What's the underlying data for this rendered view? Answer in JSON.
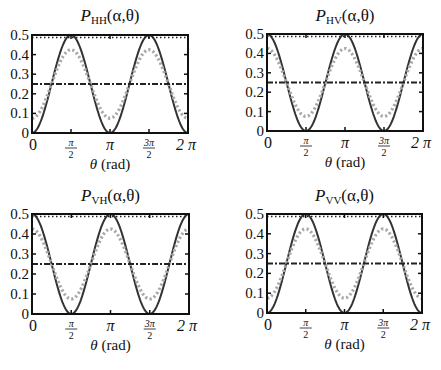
{
  "chart_data": [
    {
      "type": "line",
      "title": "P_HH(α,θ)",
      "title_main": "P",
      "title_sub": "HH",
      "title_args": "(α,θ)",
      "xlabel": "θ (rad)",
      "xlabel_sym": "θ",
      "xlabel_unit": " (rad)",
      "ylabel": "",
      "xlim": [
        0,
        6.2832
      ],
      "ylim": [
        0,
        0.5
      ],
      "xticks": [
        "0",
        "π/2",
        "π",
        "3π/2",
        "2π"
      ],
      "yticks": [
        "0",
        "0.1",
        "0.2",
        "0.3",
        "0.4",
        "0.5"
      ],
      "grid": false,
      "series": [
        {
          "name": "solid",
          "style": "solid",
          "color": "#333333",
          "formula": "0.25*(1-cos(2θ))",
          "x": [
            0,
            0.785,
            1.571,
            2.356,
            3.142,
            3.927,
            4.712,
            5.498,
            6.283
          ],
          "values": [
            0,
            0.25,
            0.5,
            0.25,
            0,
            0.25,
            0.5,
            0.25,
            0
          ]
        },
        {
          "name": "gray-dotted",
          "style": "dotted",
          "color": "#a8a8a8",
          "formula": "0.25-0.175*cos(2θ)",
          "x": [
            0,
            0.785,
            1.571,
            2.356,
            3.142,
            3.927,
            4.712,
            5.498,
            6.283
          ],
          "values": [
            0.075,
            0.25,
            0.425,
            0.25,
            0.075,
            0.25,
            0.425,
            0.25,
            0.075
          ]
        },
        {
          "name": "dash-dot",
          "style": "dashdot",
          "color": "#222222",
          "formula": "0.25",
          "x": [
            0,
            6.283
          ],
          "values": [
            0.25,
            0.25
          ]
        },
        {
          "name": "top-dotted",
          "style": "dotted-black",
          "color": "#222222",
          "formula": "0.5",
          "x": [
            0,
            6.283
          ],
          "values": [
            0.5,
            0.5
          ]
        }
      ],
      "box": {
        "left": 32,
        "top": 35,
        "right": 188,
        "bottom": 133
      }
    },
    {
      "type": "line",
      "title": "P_HV(α,θ)",
      "title_main": "P",
      "title_sub": "HV",
      "title_args": "(α,θ)",
      "xlabel": "θ (rad)",
      "xlabel_sym": "θ",
      "xlabel_unit": " (rad)",
      "ylabel": "",
      "xlim": [
        0,
        6.2832
      ],
      "ylim": [
        0,
        0.5
      ],
      "xticks": [
        "0",
        "π/2",
        "π",
        "3π/2",
        "2π"
      ],
      "yticks": [
        "0",
        "0.1",
        "0.2",
        "0.3",
        "0.4",
        "0.5"
      ],
      "grid": false,
      "series": [
        {
          "name": "solid",
          "style": "solid",
          "color": "#333333",
          "formula": "0.25*(1+cos(2θ))",
          "x": [
            0,
            0.785,
            1.571,
            2.356,
            3.142,
            3.927,
            4.712,
            5.498,
            6.283
          ],
          "values": [
            0.5,
            0.25,
            0,
            0.25,
            0.5,
            0.25,
            0,
            0.25,
            0.5
          ]
        },
        {
          "name": "gray-dotted",
          "style": "dotted",
          "color": "#a8a8a8",
          "formula": "0.25+0.175*cos(2θ)",
          "x": [
            0,
            0.785,
            1.571,
            2.356,
            3.142,
            3.927,
            4.712,
            5.498,
            6.283
          ],
          "values": [
            0.425,
            0.25,
            0.075,
            0.25,
            0.425,
            0.25,
            0.075,
            0.25,
            0.425
          ]
        },
        {
          "name": "dash-dot",
          "style": "dashdot",
          "color": "#222222",
          "formula": "0.25",
          "x": [
            0,
            6.283
          ],
          "values": [
            0.25,
            0.25
          ]
        },
        {
          "name": "top-dotted",
          "style": "dotted-black",
          "color": "#222222",
          "formula": "0.5",
          "x": [
            0,
            6.283
          ],
          "values": [
            0.5,
            0.5
          ]
        }
      ],
      "box": {
        "left": 267,
        "top": 34,
        "right": 423,
        "bottom": 131
      }
    },
    {
      "type": "line",
      "title": "P_VH(α,θ)",
      "title_main": "P",
      "title_sub": "VH",
      "title_args": "(α,θ)",
      "xlabel": "θ (rad)",
      "xlabel_sym": "θ",
      "xlabel_unit": " (rad)",
      "ylabel": "",
      "xlim": [
        0,
        6.2832
      ],
      "ylim": [
        0,
        0.5
      ],
      "xticks": [
        "0",
        "π/2",
        "π",
        "3π/2",
        "2π"
      ],
      "yticks": [
        "0",
        "0.1",
        "0.2",
        "0.3",
        "0.4",
        "0.5"
      ],
      "grid": false,
      "series": [
        {
          "name": "solid",
          "style": "solid",
          "color": "#333333",
          "formula": "0.25*(1+cos(2θ))",
          "x": [
            0,
            0.785,
            1.571,
            2.356,
            3.142,
            3.927,
            4.712,
            5.498,
            6.283
          ],
          "values": [
            0.5,
            0.25,
            0,
            0.25,
            0.5,
            0.25,
            0,
            0.25,
            0.5
          ]
        },
        {
          "name": "gray-dotted",
          "style": "dotted",
          "color": "#a8a8a8",
          "formula": "0.25+0.175*cos(2θ)",
          "x": [
            0,
            0.785,
            1.571,
            2.356,
            3.142,
            3.927,
            4.712,
            5.498,
            6.283
          ],
          "values": [
            0.425,
            0.25,
            0.075,
            0.25,
            0.425,
            0.25,
            0.075,
            0.25,
            0.425
          ]
        },
        {
          "name": "dash-dot",
          "style": "dashdot",
          "color": "#222222",
          "formula": "0.25",
          "x": [
            0,
            6.283
          ],
          "values": [
            0.25,
            0.25
          ]
        },
        {
          "name": "top-dotted",
          "style": "dotted-black",
          "color": "#222222",
          "formula": "0.5",
          "x": [
            0,
            6.283
          ],
          "values": [
            0.5,
            0.5
          ]
        }
      ],
      "box": {
        "left": 32,
        "top": 214,
        "right": 189,
        "bottom": 314
      }
    },
    {
      "type": "line",
      "title": "P_VV(α,θ)",
      "title_main": "P",
      "title_sub": "VV",
      "title_args": "(α,θ)",
      "xlabel": "θ (rad)",
      "xlabel_sym": "θ",
      "xlabel_unit": " (rad)",
      "ylabel": "",
      "xlim": [
        0,
        6.2832
      ],
      "ylim": [
        0,
        0.5
      ],
      "xticks": [
        "0",
        "π/2",
        "π",
        "3π/2",
        "2π"
      ],
      "yticks": [
        "0",
        "0.1",
        "0.2",
        "0.3",
        "0.4",
        "0.5"
      ],
      "grid": false,
      "series": [
        {
          "name": "solid",
          "style": "solid",
          "color": "#333333",
          "formula": "0.25*(1-cos(2θ))",
          "x": [
            0,
            0.785,
            1.571,
            2.356,
            3.142,
            3.927,
            4.712,
            5.498,
            6.283
          ],
          "values": [
            0,
            0.25,
            0.5,
            0.25,
            0,
            0.25,
            0.5,
            0.25,
            0
          ]
        },
        {
          "name": "gray-dotted",
          "style": "dotted",
          "color": "#a8a8a8",
          "formula": "0.25-0.175*cos(2θ)",
          "x": [
            0,
            0.785,
            1.571,
            2.356,
            3.142,
            3.927,
            4.712,
            5.498,
            6.283
          ],
          "values": [
            0.075,
            0.25,
            0.425,
            0.25,
            0.075,
            0.25,
            0.425,
            0.25,
            0.075
          ]
        },
        {
          "name": "dash-dot",
          "style": "dashdot",
          "color": "#222222",
          "formula": "0.25",
          "x": [
            0,
            6.283
          ],
          "values": [
            0.25,
            0.25
          ]
        },
        {
          "name": "top-dotted",
          "style": "dotted-black",
          "color": "#222222",
          "formula": "0.5",
          "x": [
            0,
            6.283
          ],
          "values": [
            0.5,
            0.5
          ]
        }
      ],
      "box": {
        "left": 267,
        "top": 214,
        "right": 422,
        "bottom": 313
      }
    }
  ]
}
